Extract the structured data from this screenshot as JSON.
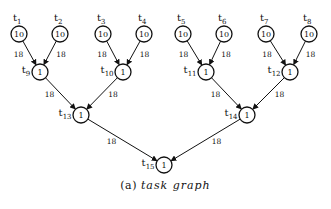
{
  "diagram": {
    "type": "task-graph",
    "caption": {
      "prefix": "(a)",
      "text": "task graph"
    },
    "nodes": [
      {
        "id": "t1",
        "label": "t",
        "sub": "1",
        "weight": "10",
        "x": 19,
        "y": 34,
        "label_pos": "top"
      },
      {
        "id": "t2",
        "label": "t",
        "sub": "2",
        "weight": "10",
        "x": 60,
        "y": 34,
        "label_pos": "top"
      },
      {
        "id": "t3",
        "label": "t",
        "sub": "3",
        "weight": "10",
        "x": 103,
        "y": 34,
        "label_pos": "top"
      },
      {
        "id": "t4",
        "label": "t",
        "sub": "4",
        "weight": "10",
        "x": 144,
        "y": 34,
        "label_pos": "top"
      },
      {
        "id": "t5",
        "label": "t",
        "sub": "5",
        "weight": "10",
        "x": 183,
        "y": 34,
        "label_pos": "top"
      },
      {
        "id": "t6",
        "label": "t",
        "sub": "6",
        "weight": "10",
        "x": 224,
        "y": 34,
        "label_pos": "top"
      },
      {
        "id": "t7",
        "label": "t",
        "sub": "7",
        "weight": "10",
        "x": 266,
        "y": 34,
        "label_pos": "top"
      },
      {
        "id": "t8",
        "label": "t",
        "sub": "8",
        "weight": "10",
        "x": 309,
        "y": 34,
        "label_pos": "top"
      },
      {
        "id": "t9",
        "label": "t",
        "sub": "9",
        "weight": "1",
        "x": 40,
        "y": 72,
        "label_pos": "left"
      },
      {
        "id": "t10",
        "label": "t",
        "sub": "10",
        "weight": "1",
        "x": 123,
        "y": 72,
        "label_pos": "left"
      },
      {
        "id": "t11",
        "label": "t",
        "sub": "11",
        "weight": "1",
        "x": 206,
        "y": 72,
        "label_pos": "left"
      },
      {
        "id": "t12",
        "label": "t",
        "sub": "12",
        "weight": "1",
        "x": 290,
        "y": 72,
        "label_pos": "left"
      },
      {
        "id": "t13",
        "label": "t",
        "sub": "13",
        "weight": "1",
        "x": 81,
        "y": 115,
        "label_pos": "left"
      },
      {
        "id": "t14",
        "label": "t",
        "sub": "14",
        "weight": "1",
        "x": 247,
        "y": 115,
        "label_pos": "left"
      },
      {
        "id": "t15",
        "label": "t",
        "sub": "15",
        "weight": "1",
        "x": 164,
        "y": 165,
        "label_pos": "left"
      }
    ],
    "edges": [
      {
        "from": "t1",
        "to": "t9",
        "weight": "18",
        "label_side": "left"
      },
      {
        "from": "t2",
        "to": "t9",
        "weight": "18",
        "label_side": "right"
      },
      {
        "from": "t3",
        "to": "t10",
        "weight": "18",
        "label_side": "left"
      },
      {
        "from": "t4",
        "to": "t10",
        "weight": "18",
        "label_side": "right"
      },
      {
        "from": "t5",
        "to": "t11",
        "weight": "18",
        "label_side": "left"
      },
      {
        "from": "t6",
        "to": "t11",
        "weight": "18",
        "label_side": "right"
      },
      {
        "from": "t7",
        "to": "t12",
        "weight": "18",
        "label_side": "left"
      },
      {
        "from": "t8",
        "to": "t12",
        "weight": "18",
        "label_side": "right"
      },
      {
        "from": "t9",
        "to": "t13",
        "weight": "18",
        "label_side": "left"
      },
      {
        "from": "t10",
        "to": "t13",
        "weight": "18",
        "label_side": "right"
      },
      {
        "from": "t11",
        "to": "t14",
        "weight": "18",
        "label_side": "left"
      },
      {
        "from": "t12",
        "to": "t14",
        "weight": "18",
        "label_side": "right"
      },
      {
        "from": "t13",
        "to": "t15",
        "weight": "18",
        "label_side": "left"
      },
      {
        "from": "t14",
        "to": "t15",
        "weight": "18",
        "label_side": "right"
      }
    ],
    "node_radius": 8,
    "colors": {
      "stroke": "#111111",
      "background": "#ffffff"
    }
  }
}
